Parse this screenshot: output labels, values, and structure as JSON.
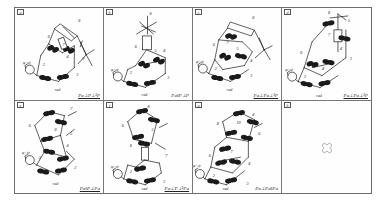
{
  "figure": {
    "type": "mechanism-linkage-panel-figure",
    "panel_count": 8,
    "grid": {
      "columns": 4,
      "rows": 2
    },
    "border_color": "#6d6d6d",
    "line_color": "#1a1a1a",
    "background": "#fefefe"
  },
  "panels": [
    {
      "id": "a",
      "label": "a",
      "caption": "Pa⊥P⊥¹P",
      "caption_underlined": true,
      "link_numbers": [
        "1",
        "2",
        "3",
        "4",
        "5",
        "6",
        "7",
        "8"
      ],
      "base_label": "φ+ψ₀",
      "ground_label": "rad",
      "has_cross_marker": false
    },
    {
      "id": "b",
      "label": "b",
      "caption": "Pa‖P⊥P",
      "caption_underlined": false,
      "link_numbers": [
        "1",
        "2",
        "3",
        "4",
        "5",
        "6",
        "7",
        "8"
      ],
      "base_label": "φ+ψ₀",
      "ground_label": "rad",
      "has_cross_marker": false
    },
    {
      "id": "c",
      "label": "c",
      "caption": "Pa⊥Pa⊥¹P",
      "caption_underlined": true,
      "link_numbers": [
        "1",
        "2",
        "3",
        "4",
        "5",
        "6",
        "7",
        "8"
      ],
      "base_label": "φ+ψ₀",
      "ground_label": "rad",
      "has_cross_marker": false
    },
    {
      "id": "d",
      "label": "d",
      "caption": "Pa⊥Pa⊥¹P",
      "caption_underlined": true,
      "link_numbers": [
        "1",
        "2",
        "3",
        "4",
        "5",
        "6",
        "7",
        "8"
      ],
      "base_label": "φ+ψ₀",
      "ground_label": "rad",
      "has_cross_marker": false
    },
    {
      "id": "e",
      "label": "e",
      "caption": "Pa‖P⊥Pa",
      "caption_underlined": true,
      "link_numbers": [
        "1",
        "2",
        "3",
        "4",
        "5",
        "6",
        "7",
        "8"
      ],
      "base_label": "φ+ψ₀",
      "ground_label": "rad",
      "has_cross_marker": false
    },
    {
      "id": "f",
      "label": "f",
      "caption": "Pa⊥P⊥¹Pa",
      "caption_underlined": true,
      "link_numbers": [
        "1",
        "2",
        "3",
        "4",
        "5",
        "6",
        "7",
        "8"
      ],
      "base_label": "φ+ψ₀",
      "ground_label": "rad",
      "has_cross_marker": false
    },
    {
      "id": "g",
      "label": "g",
      "caption": "Pa⊥Pa‖Pa",
      "caption_underlined": false,
      "link_numbers": [
        "1",
        "2",
        "3",
        "4",
        "5",
        "6",
        "7",
        "8",
        "10"
      ],
      "base_label": "φ+ψ₀",
      "ground_label": "rad",
      "has_cross_marker": false
    },
    {
      "id": "h",
      "label": "h",
      "caption": "",
      "caption_underlined": false,
      "link_numbers": [],
      "base_label": "",
      "ground_label": "",
      "has_cross_marker": true
    }
  ]
}
